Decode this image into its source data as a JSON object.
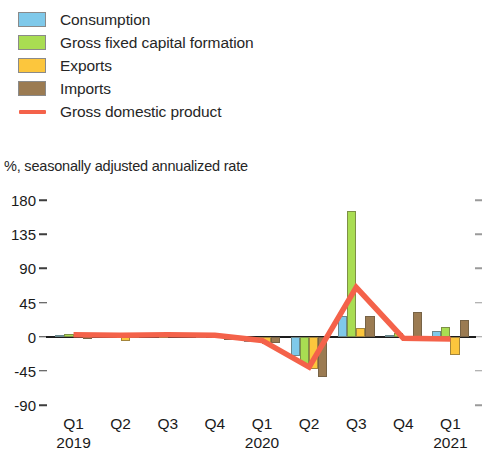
{
  "legend": {
    "items": [
      {
        "label": "Consumption",
        "color": "#7FC9EA",
        "marker": "swatch",
        "icon": "legend-swatch-icon"
      },
      {
        "label": "Gross fixed capital formation",
        "color": "#A9DD52",
        "marker": "swatch",
        "icon": "legend-swatch-icon"
      },
      {
        "label": "Exports",
        "color": "#FCC63D",
        "marker": "swatch",
        "icon": "legend-swatch-icon"
      },
      {
        "label": "Imports",
        "color": "#9B7B52",
        "marker": "swatch",
        "icon": "legend-swatch-icon"
      },
      {
        "label": "Gross domestic product",
        "color": "#F4624A",
        "marker": "line",
        "icon": "legend-line-icon"
      }
    ]
  },
  "chart_data": {
    "type": "bar",
    "title": "",
    "subtitle": "",
    "xlabel": "",
    "ylabel": "%, seasonally adjusted annualized rate",
    "ylim": [
      -90,
      180
    ],
    "yticks": [
      180,
      135,
      90,
      45,
      0,
      -45,
      -90
    ],
    "ytick_labels": [
      "180",
      "135",
      "90",
      "45",
      "0",
      "-45",
      "-90"
    ],
    "grid": false,
    "legend_position": "top-left",
    "categories": [
      "Q1",
      "Q2",
      "Q3",
      "Q4",
      "Q1",
      "Q2",
      "Q3",
      "Q4",
      "Q1"
    ],
    "year_groups": [
      {
        "year": "2019",
        "start_index": 0,
        "label_index": 0
      },
      {
        "year": "2020",
        "start_index": 4,
        "label_index": 4
      },
      {
        "year": "2021",
        "start_index": 8,
        "label_index": 8
      }
    ],
    "series": [
      {
        "name": "Consumption",
        "color": "#7FC9EA",
        "values": [
          2,
          3,
          3,
          1,
          -7,
          -25,
          27,
          2,
          7
        ]
      },
      {
        "name": "Gross fixed capital formation",
        "color": "#A9DD52",
        "values": [
          4,
          2,
          1,
          2,
          -4,
          -37,
          165,
          5,
          13
        ]
      },
      {
        "name": "Exports",
        "color": "#FCC63D",
        "values": [
          5,
          -6,
          2,
          2,
          -10,
          -42,
          12,
          -2,
          -24
        ]
      },
      {
        "name": "Imports",
        "color": "#9B7B52",
        "values": [
          -2,
          1,
          2,
          -5,
          -9,
          -53,
          27,
          32,
          22
        ]
      }
    ],
    "line_series": {
      "name": "Gross domestic product",
      "color": "#F4624A",
      "values": [
        2.5,
        2,
        2.5,
        2,
        -5,
        -40,
        65,
        -2,
        -3
      ]
    }
  },
  "colors": {
    "consumption": "#7FC9EA",
    "investment": "#A9DD52",
    "exports": "#FCC63D",
    "imports": "#9B7B52",
    "gdp_line": "#F4624A",
    "axis": "#1d1d1d",
    "text": "#1a1a1a",
    "background": "#ffffff"
  }
}
